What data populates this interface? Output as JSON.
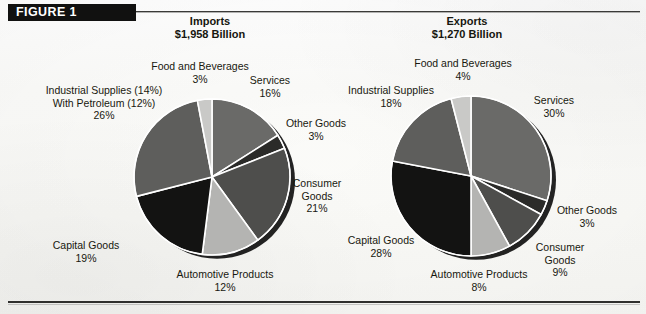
{
  "figure": {
    "banner_label": "FIGURE 1"
  },
  "charts": [
    {
      "id": "imports",
      "title": "Imports",
      "subtitle": "$1,958 Billion"
    },
    {
      "id": "exports",
      "title": "Exports",
      "subtitle": "$1,270 Billion"
    }
  ],
  "chart_data": [
    {
      "type": "pie",
      "title": "Imports",
      "subtitle": "$1,958 Billion",
      "total_label": "$1,958 Billion",
      "units": "percent of total",
      "start_angle_deg": 0,
      "direction": "clockwise",
      "labels": [
        "Services",
        "Other Goods",
        "Consumer Goods",
        "Automotive Products",
        "Capital Goods",
        "Industrial Supplies (14%) With Petroleum (12%)",
        "Food and Beverages"
      ],
      "values": [
        16,
        3,
        21,
        12,
        19,
        26,
        3
      ],
      "slice_colors": [
        "#6a6a68",
        "#2b2b29",
        "#4e4e4c",
        "#b4b4b2",
        "#131312",
        "#5e5e5c",
        "#c9c9c7"
      ],
      "legend": "none",
      "data_labels": [
        {
          "name": "Services",
          "pct": "16%"
        },
        {
          "name": "Other Goods",
          "pct": "3%"
        },
        {
          "name": "Consumer Goods",
          "pct": "21%"
        },
        {
          "name": "Automotive Products",
          "pct": "12%"
        },
        {
          "name": "Capital Goods",
          "pct": "19%"
        },
        {
          "name_line1": "Industrial Supplies (14%)",
          "name_line2": "With Petroleum (12%)",
          "pct": "26%"
        },
        {
          "name": "Food and Beverages",
          "pct": "3%"
        }
      ]
    },
    {
      "type": "pie",
      "title": "Exports",
      "subtitle": "$1,270 Billion",
      "total_label": "$1,270 Billion",
      "units": "percent of total",
      "start_angle_deg": 0,
      "direction": "clockwise",
      "labels": [
        "Services",
        "Other Goods",
        "Consumer Goods",
        "Automotive Products",
        "Capital Goods",
        "Industrial Supplies",
        "Food and Beverages"
      ],
      "values": [
        30,
        3,
        9,
        8,
        28,
        18,
        4
      ],
      "slice_colors": [
        "#6a6a68",
        "#2b2b29",
        "#4e4e4c",
        "#b4b4b2",
        "#131312",
        "#5e5e5c",
        "#c9c9c7"
      ],
      "legend": "none",
      "data_labels": [
        {
          "name": "Services",
          "pct": "30%"
        },
        {
          "name": "Other Goods",
          "pct": "3%"
        },
        {
          "name": "Consumer Goods",
          "pct": "9%"
        },
        {
          "name": "Automotive Products",
          "pct": "8%"
        },
        {
          "name": "Capital Goods",
          "pct": "28%"
        },
        {
          "name": "Industrial Supplies",
          "pct": "18%"
        },
        {
          "name": "Food and Beverages",
          "pct": "4%"
        }
      ]
    }
  ],
  "imports_labels": {
    "services_name": "Services",
    "services_pct": "16%",
    "other_goods_name": "Other Goods",
    "other_goods_pct": "3%",
    "consumer_name": "Consumer",
    "consumer_name2": "Goods",
    "consumer_pct": "21%",
    "automotive_name": "Automotive Products",
    "automotive_pct": "12%",
    "capital_name": "Capital Goods",
    "capital_pct": "19%",
    "industrial_line1": "Industrial Supplies (14%)",
    "industrial_line2": "With Petroleum (12%)",
    "industrial_pct": "26%",
    "food_name": "Food and Beverages",
    "food_pct": "3%"
  },
  "exports_labels": {
    "services_name": "Services",
    "services_pct": "30%",
    "other_goods_name": "Other Goods",
    "other_goods_pct": "3%",
    "consumer_name": "Consumer",
    "consumer_name2": "Goods",
    "consumer_pct": "9%",
    "automotive_name": "Automotive Products",
    "automotive_pct": "8%",
    "capital_name": "Capital Goods",
    "capital_pct": "28%",
    "industrial_name": "Industrial Supplies",
    "industrial_pct": "18%",
    "food_name": "Food and Beverages",
    "food_pct": "4%"
  },
  "colors": {
    "banner_bg": "#111110",
    "banner_text": "#ffffff",
    "rule": "#2f2f2d",
    "text": "#18180f",
    "paper": "#fdfdfb",
    "slice_lightest": "#c9c9c7",
    "slice_light": "#b4b4b2",
    "slice_mid": "#6a6a68",
    "slice_mid2": "#5e5e5c",
    "slice_dark": "#4e4e4c",
    "slice_darker": "#2b2b29",
    "slice_black": "#131312"
  }
}
